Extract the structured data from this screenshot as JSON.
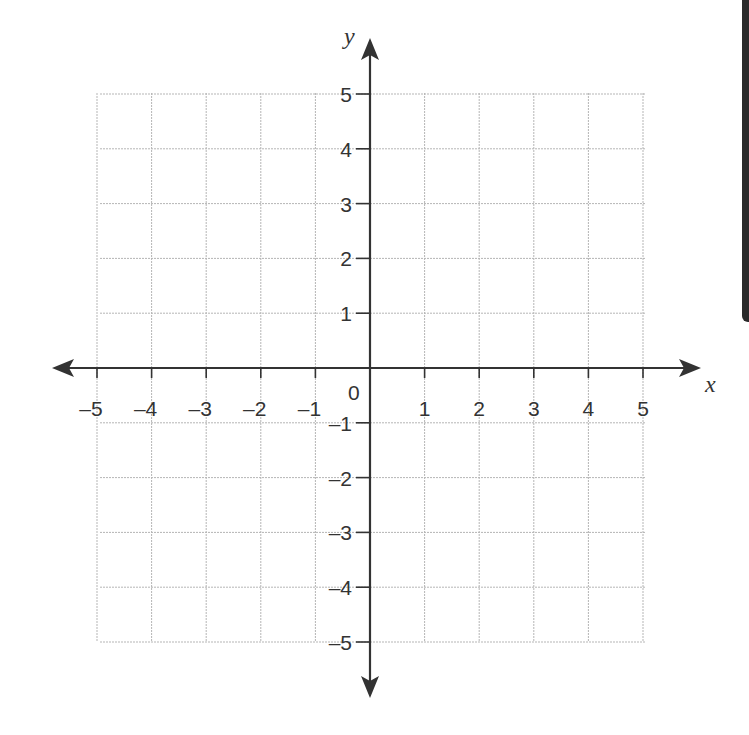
{
  "chart_data": {
    "type": "coordinate-grid",
    "title": "",
    "xlabel": "x",
    "ylabel": "y",
    "xlim": [
      -5,
      5
    ],
    "ylim": [
      -5,
      5
    ],
    "grid": true,
    "origin_label": "0",
    "x_ticks": [
      -5,
      -4,
      -3,
      -2,
      -1,
      1,
      2,
      3,
      4,
      5
    ],
    "y_ticks": [
      5,
      4,
      3,
      2,
      1,
      -1,
      -2,
      -3,
      -4,
      -5
    ],
    "x_tick_labels": [
      "–5",
      "–4",
      "–3",
      "–2",
      "–1",
      "1",
      "2",
      "3",
      "4",
      "5"
    ],
    "y_tick_labels": [
      "5",
      "4",
      "3",
      "2",
      "1",
      "–1",
      "–2",
      "–3",
      "–4",
      "–5"
    ],
    "series": []
  },
  "labels": {
    "x_axis": "x",
    "y_axis": "y",
    "origin": "0"
  },
  "colors": {
    "axis": "#333333",
    "grid": "#b5b5b5",
    "background": "#ffffff",
    "side_bar": "#2a2a2a"
  }
}
